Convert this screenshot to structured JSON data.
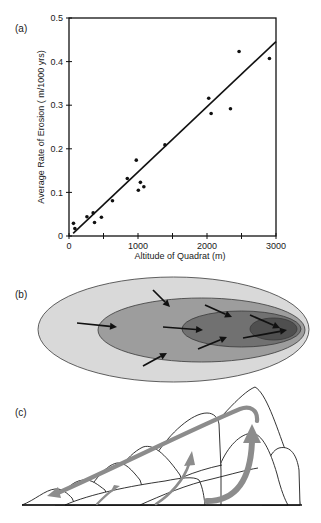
{
  "panels": {
    "a": {
      "label": "(a)"
    },
    "b": {
      "label": "(b)"
    },
    "c": {
      "label": "(c)"
    }
  },
  "colors": {
    "ink": "#111111",
    "zone_outer": "#d9d9d9",
    "zone_middle": "#9d9d9d",
    "zone_inner": "#717171",
    "zone_core": "#4f4f4f",
    "flow_arrows_c": "#8c8c8c"
  },
  "diagram_b": {
    "zone_count": 4,
    "arrow_count": 8
  },
  "diagram_c": {
    "arrow_count": 4
  },
  "chart_data": {
    "type": "scatter",
    "title": "",
    "xlabel": "Altitude of Quadrat (m)",
    "ylabel": "Average Rate of Erosion ( m/1000 yrs)",
    "xlim": [
      0,
      3000
    ],
    "ylim": [
      0,
      0.5
    ],
    "x_ticks": [
      0,
      1000,
      2000,
      3000
    ],
    "x_tick_labels": [
      "0",
      "1000",
      "2000",
      "3000"
    ],
    "x_minor_ticks": [
      500,
      1500,
      2500
    ],
    "y_ticks": [
      0,
      0.1,
      0.2,
      0.3,
      0.4,
      0.5
    ],
    "y_tick_labels": [
      "0",
      "0.1",
      "0.2",
      "0.3",
      "0.4",
      "0.5"
    ],
    "grid": false,
    "legend": null,
    "series": [
      {
        "name": "quadrat observations",
        "type": "scatter",
        "x": [
          65,
          85,
          260,
          350,
          370,
          470,
          630,
          845,
          975,
          1005,
          1035,
          1085,
          1390,
          2025,
          2060,
          2340,
          2465,
          2905
        ],
        "y": [
          0.029,
          0.017,
          0.044,
          0.053,
          0.031,
          0.043,
          0.081,
          0.132,
          0.174,
          0.105,
          0.123,
          0.113,
          0.209,
          0.316,
          0.281,
          0.292,
          0.423,
          0.407
        ]
      },
      {
        "name": "linear fit",
        "type": "line",
        "x": [
          60,
          3000
        ],
        "y": [
          0.006,
          0.446
        ]
      }
    ]
  }
}
